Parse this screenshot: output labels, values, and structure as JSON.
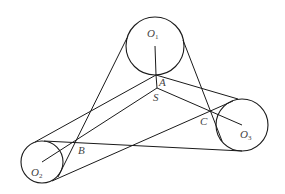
{
  "diagram": {
    "stroke_color": "#1a1a1a",
    "label_color": "#444444",
    "circles": [
      {
        "name": "O",
        "sub": "1",
        "cx": 155,
        "cy": 46,
        "r": 29
      },
      {
        "name": "O",
        "sub": "2",
        "cx": 42,
        "cy": 162,
        "r": 21
      },
      {
        "name": "O",
        "sub": "3",
        "cx": 242,
        "cy": 125,
        "r": 26
      }
    ],
    "points": {
      "A": {
        "label": "A",
        "x": 156,
        "y": 75
      },
      "S": {
        "label": "S",
        "x": 157,
        "y": 88
      },
      "B": {
        "label": "B",
        "x": 76,
        "y": 142
      },
      "C": {
        "label": "C",
        "x": 209,
        "y": 112
      }
    },
    "labels": {
      "O1_main": "O",
      "O1_sub": "1",
      "O2_main": "O",
      "O2_sub": "2",
      "O3_main": "O",
      "O3_sub": "3",
      "A": "A",
      "S": "S",
      "B": "B",
      "C": "C"
    }
  }
}
